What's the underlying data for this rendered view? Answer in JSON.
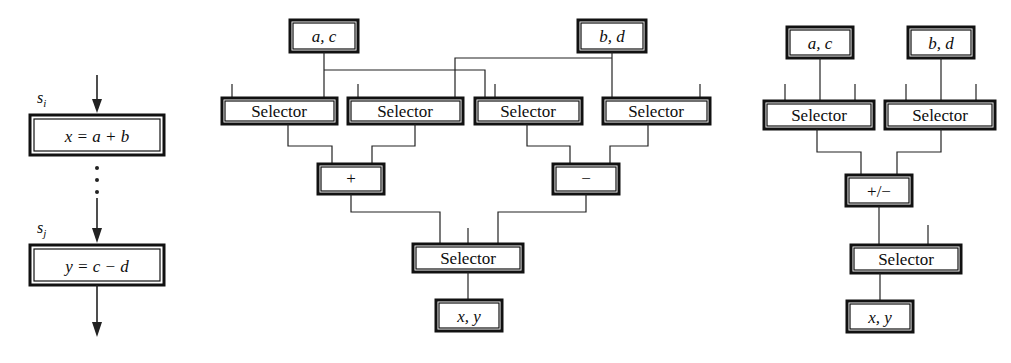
{
  "figure": {
    "type": "diagram",
    "title": "",
    "panels": [
      {
        "id": "panel-source-code",
        "name": "source-statements",
        "nodes": [
          {
            "id": "stmt-si",
            "label": "x = a + b",
            "kind": "statement-box"
          },
          {
            "id": "stmt-sj",
            "label": "y = c − d",
            "kind": "statement-box"
          }
        ],
        "labels": [
          {
            "id": "label-si",
            "text": "s",
            "subscript": "i"
          },
          {
            "id": "label-sj",
            "text": "s",
            "subscript": "j"
          }
        ],
        "ellipsis": "⋮"
      },
      {
        "id": "panel-unshared",
        "name": "unshared-datapath",
        "nodes": [
          {
            "id": "mid-reg-ac",
            "label": "a, c",
            "kind": "register-box"
          },
          {
            "id": "mid-reg-bd",
            "label": "b, d",
            "kind": "register-box"
          },
          {
            "id": "mid-sel-1",
            "label": "Selector",
            "kind": "selector-box"
          },
          {
            "id": "mid-sel-2",
            "label": "Selector",
            "kind": "selector-box"
          },
          {
            "id": "mid-sel-3",
            "label": "Selector",
            "kind": "selector-box"
          },
          {
            "id": "mid-sel-4",
            "label": "Selector",
            "kind": "selector-box"
          },
          {
            "id": "mid-alu-add",
            "label": "+",
            "kind": "operator-box"
          },
          {
            "id": "mid-alu-sub",
            "label": "−",
            "kind": "operator-box"
          },
          {
            "id": "mid-sel-out",
            "label": "Selector",
            "kind": "selector-box"
          },
          {
            "id": "mid-reg-xy",
            "label": "x, y",
            "kind": "register-box"
          }
        ]
      },
      {
        "id": "panel-shared",
        "name": "shared-datapath",
        "nodes": [
          {
            "id": "rt-reg-ac",
            "label": "a, c",
            "kind": "register-box"
          },
          {
            "id": "rt-reg-bd",
            "label": "b, d",
            "kind": "register-box"
          },
          {
            "id": "rt-sel-1",
            "label": "Selector",
            "kind": "selector-box"
          },
          {
            "id": "rt-sel-2",
            "label": "Selector",
            "kind": "selector-box"
          },
          {
            "id": "rt-alu",
            "label": "+/−",
            "kind": "operator-box"
          },
          {
            "id": "rt-sel-out",
            "label": "Selector",
            "kind": "selector-box"
          },
          {
            "id": "rt-reg-xy",
            "label": "x, y",
            "kind": "register-box"
          }
        ]
      }
    ],
    "colors": {
      "stroke": "#111111",
      "wire": "#222222",
      "background": "#ffffff",
      "text": "#0d0d0d"
    }
  }
}
